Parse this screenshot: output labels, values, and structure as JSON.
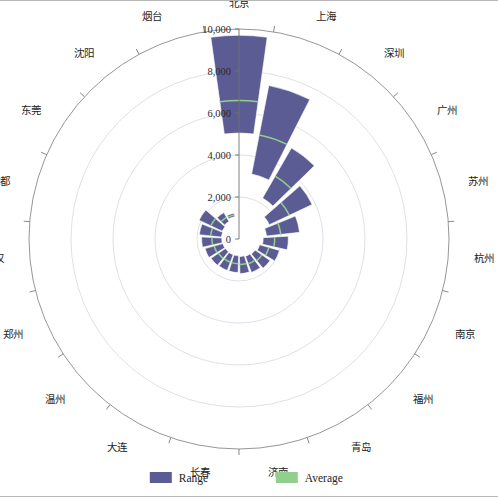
{
  "chart_data": {
    "type": "bar",
    "subtype": "polar-radial-range-bar",
    "title": "",
    "xlabel": "",
    "ylabel": "",
    "rlim": [
      0,
      10000
    ],
    "r_ticks": [
      0,
      2000,
      4000,
      6000,
      8000,
      10000
    ],
    "r_tick_labels": [
      "0",
      "2,000",
      "4,000",
      "6,000",
      "8,000",
      "10,000"
    ],
    "grid": true,
    "legend_position": "bottom",
    "start_angle_deg": 0,
    "direction": "clockwise",
    "categories": [
      "北京",
      "上海",
      "深圳",
      "广州",
      "苏州",
      "杭州",
      "南京",
      "福州",
      "青岛",
      "济南",
      "长春",
      "大连",
      "温州",
      "郑州",
      "武汉",
      "成都",
      "东莞",
      "沈阳",
      "烟台"
    ],
    "series": [
      {
        "name": "Range",
        "color": "#5c5c94",
        "type": "range",
        "low": [
          5050,
          3150,
          2250,
          1600,
          1320,
          1150,
          1020,
          930,
          880,
          840,
          800,
          800,
          790,
          800,
          820,
          840,
          880,
          960,
          1080
        ],
        "high": [
          9700,
          7450,
          5000,
          3850,
          2900,
          2350,
          2000,
          1800,
          1700,
          1650,
          1600,
          1600,
          1620,
          1680,
          1780,
          1900,
          2100,
          1450,
          1250
        ]
      },
      {
        "name": "Average",
        "color": "#90cf8c",
        "type": "line",
        "values": [
          6600,
          5050,
          3450,
          2650,
          2000,
          1700,
          1480,
          1330,
          1260,
          1220,
          1180,
          1180,
          1190,
          1230,
          1290,
          1360,
          1480,
          1190,
          1160
        ]
      }
    ]
  },
  "axis": {
    "radial_tick_labels": [
      "10,000",
      "8,000",
      "6,000",
      "4,000",
      "2,000",
      "0"
    ]
  },
  "legend": {
    "items": [
      {
        "label": "Range",
        "color": "#5c5c94"
      },
      {
        "label": "Average",
        "color": "#90cf8c"
      }
    ]
  }
}
